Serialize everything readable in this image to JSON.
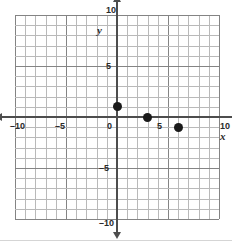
{
  "chart_data": {
    "type": "scatter",
    "title": "",
    "xlabel": "x",
    "ylabel": "y",
    "xlim": [
      -10,
      10
    ],
    "ylim": [
      -10,
      10
    ],
    "grid": true,
    "grid_step": 1,
    "major_grid_step": 5,
    "legend": "none",
    "x_ticks": [
      -10,
      -5,
      0,
      5,
      10
    ],
    "x_tick_labels": [
      "–10",
      "–5",
      "0",
      "5",
      "10"
    ],
    "y_ticks": [
      -10,
      -5,
      5,
      10
    ],
    "y_tick_labels": [
      "–10",
      "–5",
      "5",
      "10"
    ],
    "points": [
      {
        "x": 0,
        "y": 1
      },
      {
        "x": 3,
        "y": 0
      },
      {
        "x": 6,
        "y": -1
      }
    ],
    "point_color": "#1a1a1a",
    "axis_color": "#4d4d4d",
    "grid_color": "#b9b9b9",
    "major_grid_color": "#848484",
    "background": "#ffffff"
  },
  "axis_labels": {
    "x": "x",
    "y": "y"
  }
}
